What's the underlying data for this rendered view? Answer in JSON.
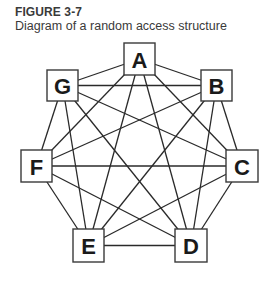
{
  "figure": {
    "label": "FIGURE 3-7",
    "caption": "Diagram of a random access structure"
  },
  "diagram": {
    "type": "complete-graph",
    "nodes": [
      {
        "id": "A",
        "label": "A",
        "x": 124,
        "y": 43,
        "w": 31,
        "h": 32
      },
      {
        "id": "B",
        "label": "B",
        "x": 201,
        "y": 70,
        "w": 31,
        "h": 31
      },
      {
        "id": "C",
        "label": "C",
        "x": 226,
        "y": 150,
        "w": 32,
        "h": 32
      },
      {
        "id": "D",
        "label": "D",
        "x": 175,
        "y": 229,
        "w": 32,
        "h": 33
      },
      {
        "id": "E",
        "label": "E",
        "x": 73,
        "y": 229,
        "w": 31,
        "h": 33
      },
      {
        "id": "F",
        "label": "F",
        "x": 21,
        "y": 150,
        "w": 31,
        "h": 32
      },
      {
        "id": "G",
        "label": "G",
        "x": 47,
        "y": 70,
        "w": 31,
        "h": 31
      }
    ],
    "edges": [
      [
        "A",
        "B"
      ],
      [
        "A",
        "C"
      ],
      [
        "A",
        "D"
      ],
      [
        "A",
        "E"
      ],
      [
        "A",
        "F"
      ],
      [
        "A",
        "G"
      ],
      [
        "B",
        "C"
      ],
      [
        "B",
        "D"
      ],
      [
        "B",
        "E"
      ],
      [
        "B",
        "F"
      ],
      [
        "B",
        "G"
      ],
      [
        "C",
        "D"
      ],
      [
        "C",
        "E"
      ],
      [
        "C",
        "F"
      ],
      [
        "C",
        "G"
      ],
      [
        "D",
        "E"
      ],
      [
        "D",
        "F"
      ],
      [
        "D",
        "G"
      ],
      [
        "E",
        "F"
      ],
      [
        "E",
        "G"
      ],
      [
        "F",
        "G"
      ]
    ]
  }
}
